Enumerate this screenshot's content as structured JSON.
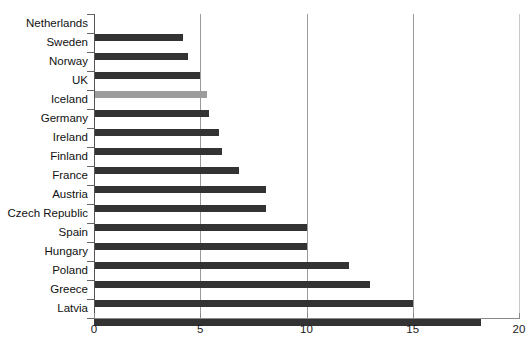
{
  "chart_data": {
    "type": "bar",
    "orientation": "horizontal",
    "title": "",
    "subtitle": "",
    "xlabel": "",
    "ylabel": "",
    "xlim": [
      0,
      20
    ],
    "ylim": null,
    "grid": true,
    "grid_axis": "x",
    "legend": false,
    "legend_position": "none",
    "xticks": [
      0,
      5,
      10,
      15,
      20
    ],
    "xtick_labels": [
      "0",
      "5",
      "10",
      "15",
      "20"
    ],
    "categories": [
      "Netherlands",
      "Sweden",
      "Norway",
      "UK",
      "Iceland",
      "Germany",
      "Ireland",
      "Finland",
      "France",
      "Austria",
      "Czech Republic",
      "Spain",
      "Hungary",
      "Poland",
      "Greece",
      "Latvia"
    ],
    "values": [
      4.2,
      4.4,
      5.0,
      5.3,
      5.4,
      5.9,
      6.0,
      6.8,
      8.1,
      8.1,
      10.0,
      10.0,
      12.0,
      13.0,
      15.0,
      18.2
    ],
    "bar_colors": [
      "#333333",
      "#333333",
      "#333333",
      "#9d9d9d",
      "#333333",
      "#333333",
      "#333333",
      "#333333",
      "#333333",
      "#333333",
      "#333333",
      "#333333",
      "#333333",
      "#333333",
      "#333333",
      "#333333"
    ],
    "highlight_category": "UK",
    "colors": {
      "bar_default": "#333333",
      "bar_highlight": "#9d9d9d",
      "gridline": "#9a9a9a",
      "gridline_faint": "#c9c9c9",
      "axis": "#555555",
      "text": "#111111",
      "background": "#ffffff"
    }
  }
}
